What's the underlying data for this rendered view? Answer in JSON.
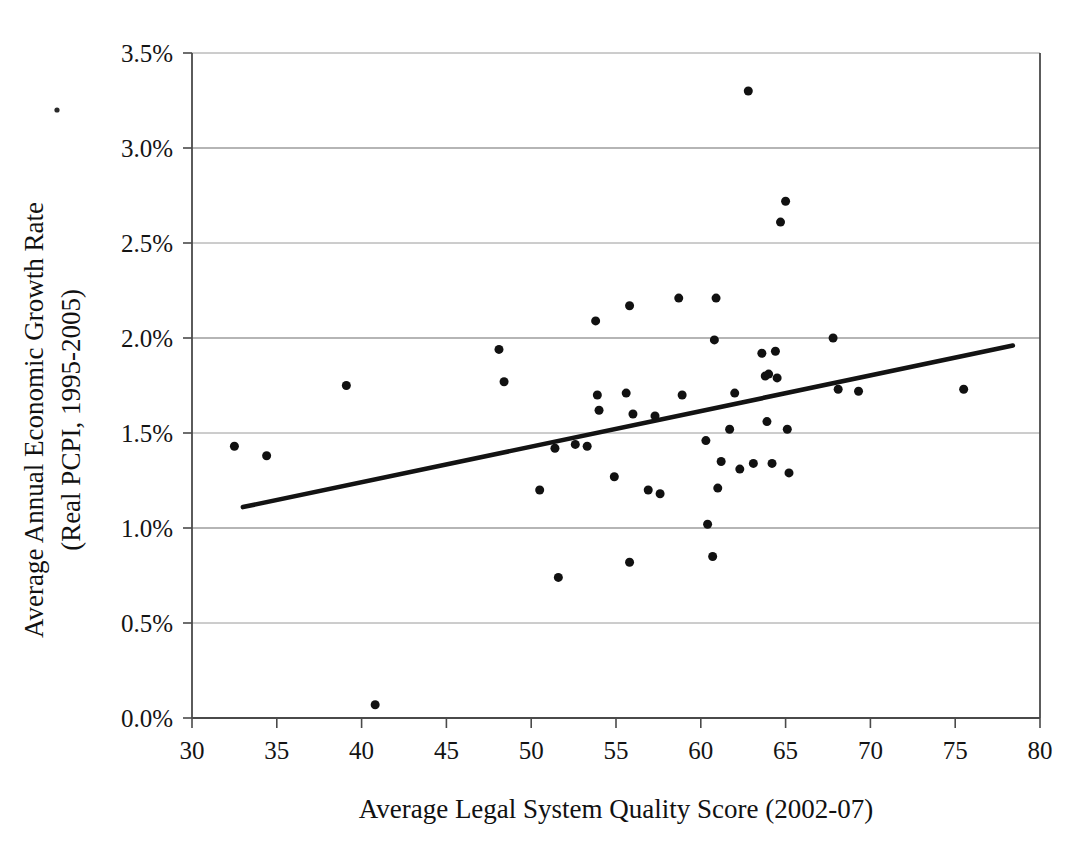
{
  "chart_data": {
    "type": "scatter",
    "title": "",
    "xlabel": "Average Legal System Quality Score (2002-07)",
    "ylabel": "Average Annual Economic Growth Rate (Real PCPI, 1995-2005)",
    "ylabel_line1": "Average Annual Economic Growth Rate",
    "ylabel_line2": "(Real PCPI, 1995-2005)",
    "xlim": [
      30,
      80
    ],
    "ylim": [
      0.0,
      3.5
    ],
    "xticks": [
      30,
      35,
      40,
      45,
      50,
      55,
      60,
      65,
      70,
      75,
      80
    ],
    "xtick_labels": [
      "30",
      "35",
      "40",
      "45",
      "50",
      "55",
      "60",
      "65",
      "70",
      "75",
      "80"
    ],
    "yticks": [
      0.0,
      0.5,
      1.0,
      1.5,
      2.0,
      2.5,
      3.0,
      3.5
    ],
    "ytick_labels": [
      "0.0%",
      "0.5%",
      "1.0%",
      "1.5%",
      "2.0%",
      "2.5%",
      "3.0%",
      "3.5%"
    ],
    "grid": true,
    "grid_axis": "y",
    "legend": false,
    "legend_position": "none",
    "marker_color": "#111111",
    "marker_size": 9,
    "trendline": {
      "visible": true,
      "color": "#131313",
      "x_start": 33.0,
      "y_start": 1.11,
      "x_end": 78.4,
      "y_end": 1.96
    },
    "points": [
      {
        "x": 32.5,
        "y": 1.43
      },
      {
        "x": 34.4,
        "y": 1.38
      },
      {
        "x": 39.1,
        "y": 1.75
      },
      {
        "x": 40.8,
        "y": 0.07
      },
      {
        "x": 48.1,
        "y": 1.94
      },
      {
        "x": 48.4,
        "y": 1.77
      },
      {
        "x": 50.5,
        "y": 1.2
      },
      {
        "x": 51.4,
        "y": 1.42
      },
      {
        "x": 51.6,
        "y": 0.74
      },
      {
        "x": 52.6,
        "y": 1.44
      },
      {
        "x": 53.3,
        "y": 1.43
      },
      {
        "x": 53.8,
        "y": 2.09
      },
      {
        "x": 53.9,
        "y": 1.7
      },
      {
        "x": 54.0,
        "y": 1.62
      },
      {
        "x": 54.9,
        "y": 1.27
      },
      {
        "x": 55.6,
        "y": 1.71
      },
      {
        "x": 55.8,
        "y": 2.17
      },
      {
        "x": 55.8,
        "y": 0.82
      },
      {
        "x": 56.0,
        "y": 1.6
      },
      {
        "x": 56.9,
        "y": 1.2
      },
      {
        "x": 57.3,
        "y": 1.59
      },
      {
        "x": 57.6,
        "y": 1.18
      },
      {
        "x": 58.7,
        "y": 2.21
      },
      {
        "x": 58.9,
        "y": 1.7
      },
      {
        "x": 60.3,
        "y": 1.46
      },
      {
        "x": 60.4,
        "y": 1.02
      },
      {
        "x": 60.7,
        "y": 0.85
      },
      {
        "x": 60.8,
        "y": 1.99
      },
      {
        "x": 60.9,
        "y": 2.21
      },
      {
        "x": 61.0,
        "y": 1.21
      },
      {
        "x": 61.2,
        "y": 1.35
      },
      {
        "x": 61.7,
        "y": 1.52
      },
      {
        "x": 62.0,
        "y": 1.71
      },
      {
        "x": 62.3,
        "y": 1.31
      },
      {
        "x": 62.8,
        "y": 3.3
      },
      {
        "x": 63.1,
        "y": 1.34
      },
      {
        "x": 63.6,
        "y": 1.92
      },
      {
        "x": 63.8,
        "y": 1.8
      },
      {
        "x": 63.9,
        "y": 1.56
      },
      {
        "x": 64.0,
        "y": 1.81
      },
      {
        "x": 64.2,
        "y": 1.34
      },
      {
        "x": 64.4,
        "y": 1.93
      },
      {
        "x": 64.5,
        "y": 1.79
      },
      {
        "x": 64.7,
        "y": 2.61
      },
      {
        "x": 65.0,
        "y": 2.72
      },
      {
        "x": 65.1,
        "y": 1.52
      },
      {
        "x": 65.2,
        "y": 1.29
      },
      {
        "x": 67.8,
        "y": 2.0
      },
      {
        "x": 68.1,
        "y": 1.73
      },
      {
        "x": 69.3,
        "y": 1.72
      },
      {
        "x": 75.5,
        "y": 1.73
      }
    ]
  }
}
